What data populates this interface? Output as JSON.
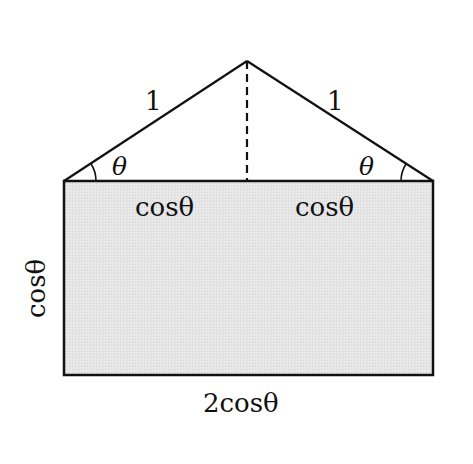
{
  "diagram": {
    "type": "geometry",
    "colors": {
      "stroke": "#111111",
      "rect_fill": "#e3e3e3",
      "background": "#ffffff"
    },
    "triangle": {
      "left_side_label": "1",
      "right_side_label": "1",
      "left_angle_label": "θ",
      "right_angle_label": "θ",
      "altitude": "dashed"
    },
    "rectangle": {
      "top_left_segment_label": "cosθ",
      "top_right_segment_label": "cosθ",
      "left_side_label": "cosθ",
      "bottom_label": "2cosθ"
    }
  }
}
